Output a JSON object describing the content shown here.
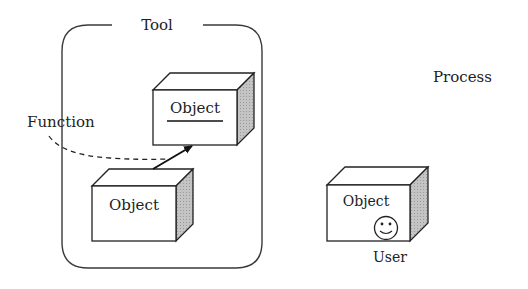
{
  "diagram": {
    "tool_group": {
      "label": "Tool"
    },
    "function_label": "Function",
    "process_label": "Process",
    "objects": [
      {
        "id": "object-top",
        "label": "Object",
        "underlined": true
      },
      {
        "id": "object-bottom",
        "label": "Object",
        "underlined": false
      },
      {
        "id": "object-user",
        "label": "Object",
        "underlined": false,
        "icon": "smiley-face-icon",
        "caption": "User"
      }
    ],
    "colors": {
      "stroke": "#2a2a2a",
      "side_face": "#b8b8b8",
      "background": "#ffffff"
    }
  }
}
